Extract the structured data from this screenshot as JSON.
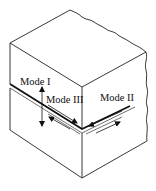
{
  "figure": {
    "labels": {
      "mode1": "Mode I",
      "mode2": "Mode II",
      "mode3": "Mode III"
    },
    "colors": {
      "line": "#222222",
      "crack": "#111111",
      "background": "#ffffff"
    }
  }
}
